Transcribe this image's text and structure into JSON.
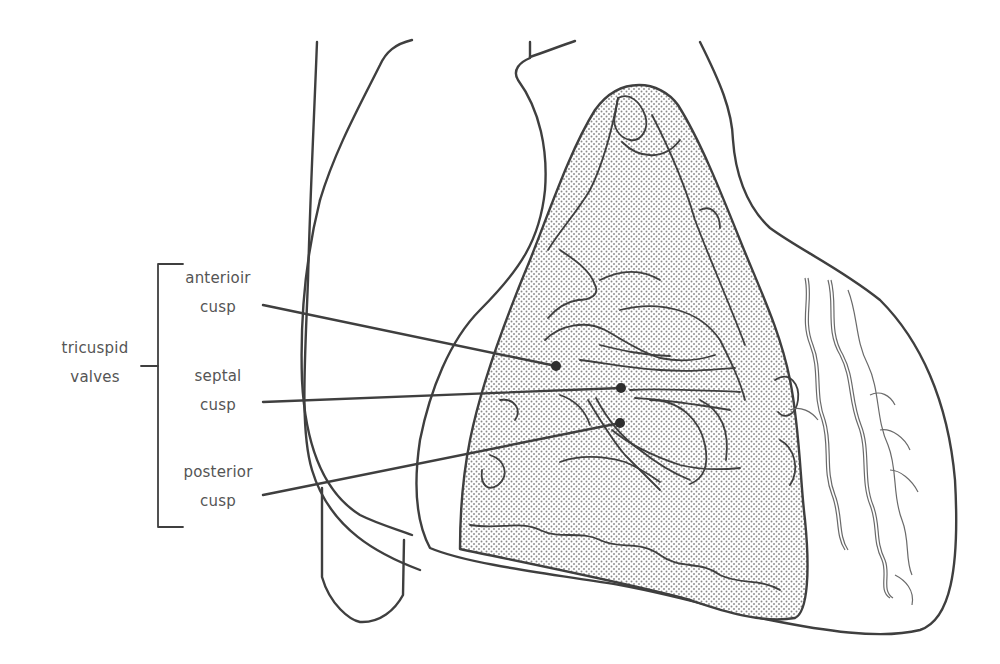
{
  "diagram": {
    "group_label": {
      "line1": "tricuspid",
      "line2": "valves"
    },
    "callouts": [
      {
        "line1": "anterioir",
        "line2": "cusp",
        "dot": [
          556,
          366
        ]
      },
      {
        "line1": "septal",
        "line2": "cusp",
        "dot": [
          621,
          388
        ]
      },
      {
        "line1": "posterior",
        "line2": "cusp",
        "dot": [
          620,
          423
        ]
      }
    ],
    "colors": {
      "line": "#3f3f3f",
      "label_text": "#555555",
      "stipple": "#8a8a8a",
      "background": "#ffffff"
    }
  }
}
